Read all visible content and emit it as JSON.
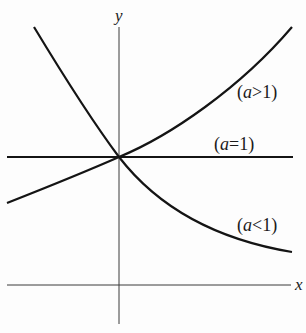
{
  "figure": {
    "axes": {
      "x_label": "x",
      "y_label": "y"
    },
    "curves": [
      {
        "id": "a-greater-1",
        "label_open": "(",
        "label_var": "a",
        "label_rel": ">",
        "label_num": "1",
        "label_close": ")",
        "label": "(a>1)"
      },
      {
        "id": "a-equal-1",
        "label_open": "(",
        "label_var": "a",
        "label_rel": "=",
        "label_num": "1",
        "label_close": ")",
        "label": "(a=1)"
      },
      {
        "id": "a-less-1",
        "label_open": "(",
        "label_var": "a",
        "label_rel": "<",
        "label_num": "1",
        "label_close": ")",
        "label": "(a<1)"
      }
    ],
    "colors": {
      "curve": "#141414",
      "axis": "#3a3a3a",
      "background": "#fdfdfd"
    }
  }
}
